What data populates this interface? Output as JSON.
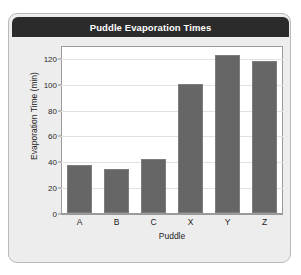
{
  "card": {
    "title": "Puddle Evaporation Times"
  },
  "chart_data": {
    "type": "bar",
    "title": "Puddle Evaporation Times",
    "categories": [
      "A",
      "B",
      "C",
      "X",
      "Y",
      "Z"
    ],
    "values": [
      37,
      34,
      42,
      100,
      122,
      118
    ],
    "xlabel": "Puddle",
    "ylabel": "Evaporation Time (min)",
    "ylim": [
      0,
      130
    ],
    "yticks": [
      0,
      20,
      40,
      60,
      80,
      100,
      120
    ],
    "ytick_labels": [
      "0",
      "20",
      "40",
      "60",
      "80",
      "100",
      "120"
    ],
    "grid": "horizontal",
    "legend": "none",
    "bar_color": "#666666",
    "plot_background": "#ffffff",
    "title_bar_color": "#2b2b2b",
    "card_background": "#ededed"
  }
}
